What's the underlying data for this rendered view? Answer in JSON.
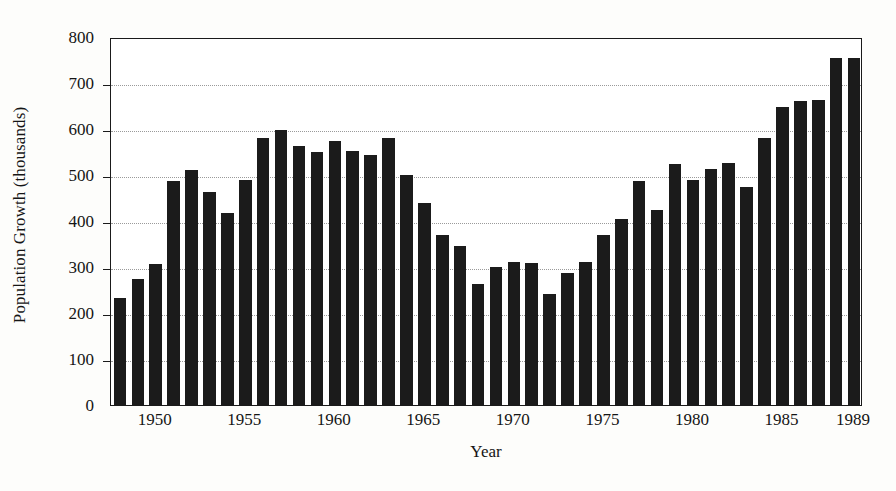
{
  "chart_data": {
    "type": "bar",
    "title": "",
    "xlabel": "Year",
    "ylabel": "Population Growth (thousands)",
    "ylim": [
      0,
      800
    ],
    "ytick_values": [
      0,
      100,
      200,
      300,
      400,
      500,
      600,
      700,
      800
    ],
    "ytick_labels": [
      "0",
      "100",
      "200",
      "300",
      "400",
      "500",
      "600",
      "700",
      "800"
    ],
    "xtick_labels": [
      "1950",
      "1955",
      "1960",
      "1965",
      "1970",
      "1975",
      "1980",
      "1985",
      "1989"
    ],
    "xtick_years": [
      1950,
      1955,
      1960,
      1965,
      1970,
      1975,
      1980,
      1985,
      1989
    ],
    "grid": true,
    "legend": "none",
    "bar_color": "#1b1b1b",
    "categories": [
      1948,
      1949,
      1950,
      1951,
      1952,
      1953,
      1954,
      1955,
      1956,
      1957,
      1958,
      1959,
      1960,
      1961,
      1962,
      1963,
      1964,
      1965,
      1966,
      1967,
      1968,
      1969,
      1970,
      1971,
      1972,
      1973,
      1974,
      1975,
      1976,
      1977,
      1978,
      1979,
      1980,
      1981,
      1982,
      1983,
      1984,
      1985,
      1986,
      1987,
      1988,
      1989
    ],
    "values": [
      233,
      274,
      306,
      487,
      511,
      464,
      418,
      489,
      580,
      598,
      564,
      549,
      573,
      553,
      543,
      581,
      499,
      440,
      370,
      346,
      262,
      299,
      311,
      308,
      241,
      287,
      310,
      369,
      405,
      487,
      425,
      525,
      490,
      513,
      526,
      474,
      581,
      647,
      661,
      664,
      755,
      755
    ]
  },
  "axes": {
    "x_start_year": 1948,
    "x_end_year": 1989
  }
}
